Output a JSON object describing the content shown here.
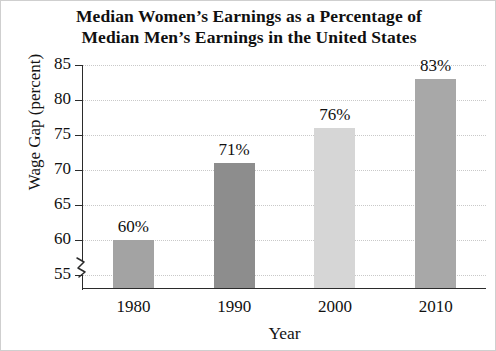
{
  "chart_data": {
    "type": "bar",
    "title_lines": [
      "Median Women’s Earnings as a Percentage of",
      "Median Men’s Earnings in the United States"
    ],
    "xlabel": "Year",
    "ylabel": "Wage Gap (percent)",
    "categories": [
      "1980",
      "1990",
      "2000",
      "2010"
    ],
    "values": [
      60,
      71,
      76,
      83
    ],
    "data_labels": [
      "60%",
      "71%",
      "76%",
      "83%"
    ],
    "bar_colors": [
      "#a3a3a3",
      "#8d8d8d",
      "#d6d6d6",
      "#a8a8a8"
    ],
    "ylim": [
      53,
      85
    ],
    "yticks": [
      85,
      80,
      75,
      70,
      65,
      60,
      55
    ],
    "ytick_labels": [
      "85",
      "80",
      "75",
      "70",
      "65",
      "60",
      "55"
    ],
    "grid": true,
    "axis_break": true,
    "legend": "none"
  },
  "axis": {
    "break_icon": "axis-break-icon"
  }
}
